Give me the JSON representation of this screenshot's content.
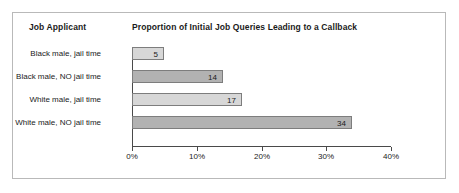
{
  "header": {
    "category_header": "Job Applicant",
    "chart_title": "Proportion of Initial Job Queries Leading to a Callback"
  },
  "colors": {
    "frame_border": "#b9b9b9",
    "bar_light": "#d7d7d7",
    "bar_dark": "#b2b2b2",
    "bar_outline": "#7d7d7d",
    "axis": "#4a4a4a",
    "text": "#1b1b1b",
    "background": "#ffffff"
  },
  "chart_data": {
    "type": "bar",
    "orientation": "horizontal",
    "title": "Proportion of Initial Job Queries Leading to a Callback",
    "xlabel": "",
    "ylabel": "Job Applicant",
    "categories": [
      "Black male, jail time",
      "Black male, NO jail time",
      "White male, jail time",
      "White male, NO jail time"
    ],
    "values": [
      5,
      14,
      17,
      34
    ],
    "value_labels": [
      "5",
      "14",
      "17",
      "34"
    ],
    "bar_shades": [
      "light",
      "dark",
      "light",
      "dark"
    ],
    "xlim": [
      0,
      40
    ],
    "xticks": [
      0,
      10,
      20,
      30,
      40
    ],
    "xtick_labels": [
      "0%",
      "10%",
      "20%",
      "30%",
      "40%"
    ],
    "grid": false,
    "legend": false
  }
}
